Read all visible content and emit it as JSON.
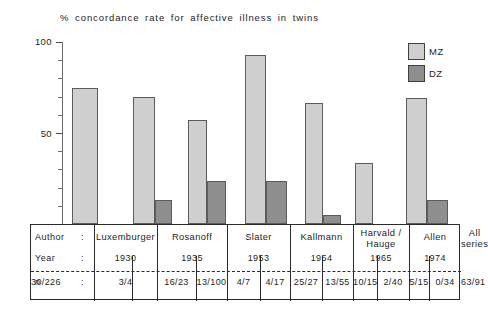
{
  "chart": {
    "title": "% concordance rate for  affective illness in twins"
  },
  "axis": {
    "ylabels": [
      "100",
      "50"
    ],
    "ytick_values": [
      100,
      90,
      80,
      70,
      60,
      50,
      40,
      30,
      20,
      10
    ],
    "ymin": 0,
    "ymax": 100
  },
  "legend": {
    "items": [
      {
        "label": "MZ",
        "color": "#cfcfcf",
        "icon": "square-swatch-icon"
      },
      {
        "label": "DZ",
        "color": "#8e8e8e",
        "icon": "square-swatch-icon"
      }
    ]
  },
  "table": {
    "row_labels": [
      "Author",
      "Year",
      "n"
    ],
    "colon": ":",
    "authors": [
      "Luxemburger",
      "Rosanoff",
      "Slater",
      "Kallmann",
      "Harvald /\nHauge",
      "Allen",
      "All\nseries"
    ],
    "years": [
      "1930",
      "1935",
      "1953",
      "1954",
      "1965",
      "1974",
      ""
    ],
    "n_mz": [
      "3/4",
      "16/23",
      "4/7",
      "25/27",
      "10/15",
      "5/15",
      "63/91"
    ],
    "n_dz": [
      "",
      "13/100",
      "4/17",
      "13/55",
      "2/40",
      "0/34",
      "30/226"
    ]
  },
  "chart_data": {
    "type": "bar",
    "title": "% concordance rate for  affective illness in twins",
    "xlabel": "",
    "ylabel": "% concordance rate",
    "ylim": [
      0,
      100
    ],
    "grid": false,
    "legend_position": "top-right",
    "categories": [
      "Luxemburger",
      "Rosanoff",
      "Slater",
      "Kallmann",
      "Harvald / Hauge",
      "Allen",
      "All series"
    ],
    "years": [
      1930,
      1935,
      1953,
      1954,
      1965,
      1974,
      null
    ],
    "series": [
      {
        "name": "MZ",
        "color": "#cfcfcf",
        "values": [
          75,
          69.6,
          57.1,
          92.6,
          66.7,
          33.3,
          69.2
        ],
        "fractions": [
          "3/4",
          "16/23",
          "4/7",
          "25/27",
          "10/15",
          "5/15",
          "63/91"
        ]
      },
      {
        "name": "DZ",
        "color": "#8e8e8e",
        "values": [
          null,
          13,
          23.5,
          23.6,
          5,
          0,
          13.3
        ],
        "fractions": [
          null,
          "13/100",
          "4/17",
          "13/55",
          "2/40",
          "0/34",
          "30/226"
        ]
      }
    ]
  },
  "geometry": {
    "baseline_y": 224,
    "top_y": 42,
    "pixels_per_unit": 1.82,
    "bars": [
      {
        "series": "MZ",
        "x": 72,
        "w": 26,
        "value": 75
      },
      {
        "series": "MZ",
        "x": 133,
        "w": 22,
        "value": 69.6
      },
      {
        "series": "DZ",
        "x": 155,
        "w": 17,
        "value": 13
      },
      {
        "series": "MZ",
        "x": 188,
        "w": 19,
        "value": 57.1
      },
      {
        "series": "DZ",
        "x": 207,
        "w": 19,
        "value": 23.5
      },
      {
        "series": "MZ",
        "x": 245,
        "w": 21,
        "value": 92.6
      },
      {
        "series": "DZ",
        "x": 266,
        "w": 21,
        "value": 23.6
      },
      {
        "series": "MZ",
        "x": 305,
        "w": 18,
        "value": 66.7
      },
      {
        "series": "DZ",
        "x": 323,
        "w": 18,
        "value": 5
      },
      {
        "series": "MZ",
        "x": 355,
        "w": 18,
        "value": 33.3
      },
      {
        "series": "DZ",
        "x": 373,
        "w": 18,
        "value": 0
      },
      {
        "series": "MZ",
        "x": 406,
        "w": 21,
        "value": 69.2
      },
      {
        "series": "DZ",
        "x": 427,
        "w": 21,
        "value": 13.3
      }
    ],
    "table_columns": [
      30,
      93,
      156,
      226,
      289,
      352,
      408,
      460
    ],
    "table_inner_dividers": [
      131,
      195,
      259,
      321,
      376,
      428
    ]
  }
}
